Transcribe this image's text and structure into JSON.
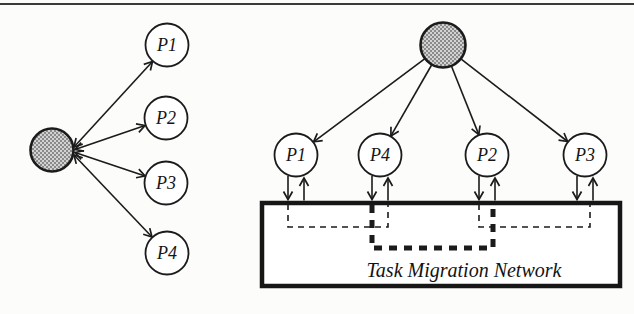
{
  "page": {
    "background": "#fcfcfa",
    "ink": "#1b1b1b",
    "top_rule_color": "#3a3a3a"
  },
  "left_diagram": {
    "description": "central scheduler star: shaded hub with bidirectional arrows to four processors",
    "hub": {
      "type": "shaded-scheduler-node",
      "fill_light": "#d2d2d2",
      "fill_dark": "#8a8a8a"
    },
    "nodes": [
      {
        "label": "P1"
      },
      {
        "label": "P2"
      },
      {
        "label": "P3"
      },
      {
        "label": "P4"
      }
    ],
    "links": [
      {
        "from": "hub",
        "to": "P1",
        "bidirectional": true
      },
      {
        "from": "hub",
        "to": "P2",
        "bidirectional": true
      },
      {
        "from": "hub",
        "to": "P3",
        "bidirectional": true
      },
      {
        "from": "hub",
        "to": "P4",
        "bidirectional": true
      }
    ]
  },
  "right_diagram": {
    "description": "scheduler fans out to processors; each processor exchanges tasks with a task migration network",
    "hub": {
      "type": "shaded-scheduler-node",
      "fill_light": "#d2d2d2",
      "fill_dark": "#8a8a8a"
    },
    "nodes": [
      {
        "label": "P1"
      },
      {
        "label": "P4"
      },
      {
        "label": "P2"
      },
      {
        "label": "P3"
      }
    ],
    "network_box_label": "Task Migration Network",
    "migration_links": [
      {
        "from": "P1",
        "to": "P4",
        "style": "thin-dashed"
      },
      {
        "from": "P4",
        "to": "P2",
        "style": "thick-dashed"
      },
      {
        "from": "P2",
        "to": "P3",
        "style": "thin-dashed"
      }
    ]
  }
}
